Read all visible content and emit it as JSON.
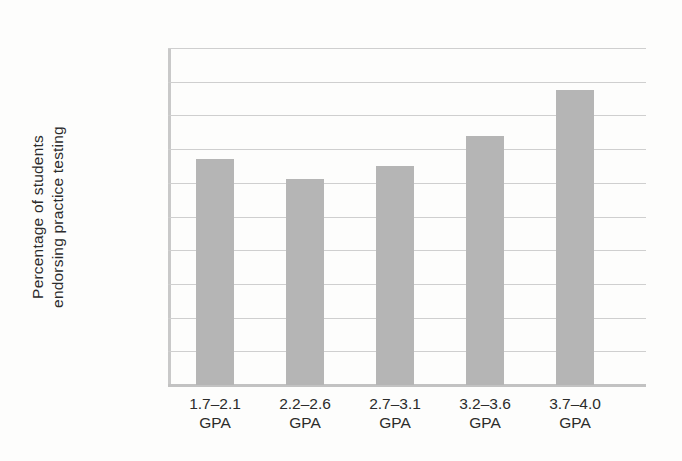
{
  "chart_data": {
    "type": "bar",
    "title": "",
    "xlabel": "",
    "ylabel_line1": "Percentage of students",
    "ylabel_line2": "endorsing practice testing",
    "categories": [
      "1.7–2.1",
      "2.2–2.6",
      "2.7–3.1",
      "3.2–3.6",
      "3.7–4.0"
    ],
    "category_suffix": "GPA",
    "values": [
      67,
      61,
      65,
      74,
      87.5
    ],
    "ylim": [
      0,
      100
    ],
    "ytick_values": [
      0,
      10,
      20,
      30,
      40,
      50,
      60,
      70,
      80,
      90,
      100
    ],
    "ytick_labels": [
      "0",
      "10",
      "20",
      "30",
      "40",
      "50",
      "60",
      "70",
      "80",
      "90",
      "100%"
    ],
    "grid": true,
    "legend": "none",
    "bar_color": "#b5b5b5",
    "gridline_color": "#cfcfcf",
    "axis_color": "#c9c9c9",
    "background_color": "#fdfdfc"
  }
}
